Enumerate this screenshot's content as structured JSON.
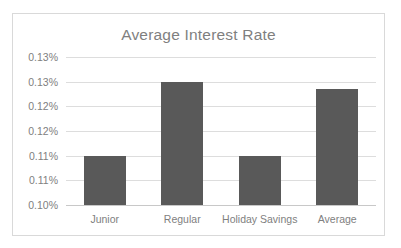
{
  "chart_data": {
    "type": "bar",
    "title": "Average Interest Rate",
    "xlabel": "",
    "ylabel": "",
    "categories": [
      "Junior",
      "Regular",
      "Holiday Savings",
      "Average"
    ],
    "values": [
      0.11,
      0.125,
      0.11,
      0.1235
    ],
    "value_labels": [
      "0.11%",
      "0.13%",
      "0.11%",
      "0.12%"
    ],
    "ylim": [
      0.1,
      0.13
    ],
    "ytick_values": [
      0.13,
      0.125,
      0.12,
      0.115,
      0.11,
      0.105,
      0.1
    ],
    "ytick_labels": [
      "0.13%",
      "0.13%",
      "0.12%",
      "0.12%",
      "0.11%",
      "0.11%",
      "0.10%"
    ],
    "grid": true,
    "legend": false,
    "series": [
      {
        "name": "Average Interest Rate",
        "values": [
          0.11,
          0.125,
          0.11,
          0.1235
        ]
      }
    ],
    "colors": {
      "bar": "#595959",
      "title_text": "#7f7f7f",
      "tick_text": "#808080",
      "gridline": "#dddddd",
      "axis_line": "#c8c8c8",
      "plot_background": "#ffffff",
      "frame_border": "#d9d9d9"
    }
  }
}
